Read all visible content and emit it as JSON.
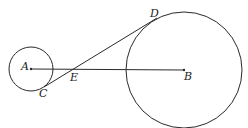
{
  "diagram": {
    "type": "geometry",
    "colors": {
      "stroke": "#2a2a2a",
      "background": "#ffffff"
    },
    "circles": [
      {
        "name": "circle-A",
        "center": "A",
        "cx": 31,
        "cy": 69,
        "r": 22
      },
      {
        "name": "circle-B",
        "center": "B",
        "cx": 184,
        "cy": 70,
        "r": 58
      }
    ],
    "segments": [
      {
        "name": "segment-AB",
        "from": "A",
        "to": "B"
      },
      {
        "name": "segment-CD",
        "from": "C",
        "to": "D"
      }
    ],
    "points": {
      "A": {
        "label": "A",
        "x": 31,
        "y": 69
      },
      "B": {
        "label": "B",
        "x": 184,
        "y": 70
      },
      "C": {
        "label": "C",
        "x": 44,
        "y": 87
      },
      "D": {
        "label": "D",
        "x": 155,
        "y": 19
      },
      "E": {
        "label": "E",
        "x": 74,
        "y": 69
      }
    }
  }
}
